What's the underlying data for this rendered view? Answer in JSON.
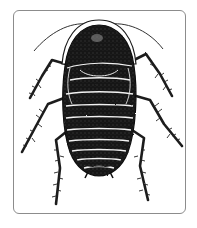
{
  "image": {
    "subject": "cockroach illustration",
    "style": "black-and-white pen-and-ink drawing",
    "view": "dorsal (top-down)",
    "frame": {
      "shape": "rounded rectangle",
      "border_color": "#8c8c8c",
      "background": "#ffffff"
    },
    "colors": {
      "body": "#1a1a1a",
      "segment_lines": "#f2f2f2",
      "legs": "#1e1e1e",
      "antennae": "#333333"
    },
    "parts": {
      "antennae": 2,
      "legs": 6,
      "abdominal_segments": 9
    }
  }
}
